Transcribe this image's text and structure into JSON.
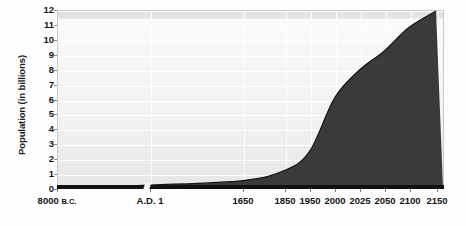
{
  "chart_data": {
    "type": "area",
    "title": "",
    "xlabel": "",
    "ylabel": "Population (in billions)",
    "ylim": [
      0,
      12
    ],
    "yticks": [
      0,
      1,
      2,
      3,
      4,
      5,
      6,
      7,
      8,
      9,
      10,
      11,
      12
    ],
    "ytick_labels": [
      "0",
      "1",
      "2",
      "3",
      "4",
      "5",
      "6",
      "7",
      "8",
      "9",
      "10",
      "11",
      "12"
    ],
    "grid": true,
    "legend": "none",
    "axis_break": true,
    "axis_break_note": "compressed time axis between 8000 B.C. and A.D. 1",
    "categories": [
      "8000 B.C.",
      "A.D. 1",
      "1650",
      "1850",
      "1950",
      "2000",
      "2025",
      "2050",
      "2100",
      "2150"
    ],
    "xtick_labels": [
      {
        "main": "8000",
        "small": "B.C."
      },
      {
        "main": "A.D. 1",
        "small": ""
      },
      {
        "main": "1650",
        "small": ""
      },
      {
        "main": "1850",
        "small": ""
      },
      {
        "main": "1950",
        "small": ""
      },
      {
        "main": "2000",
        "small": ""
      },
      {
        "main": "2025",
        "small": ""
      },
      {
        "main": "2050",
        "small": ""
      },
      {
        "main": "2100",
        "small": ""
      },
      {
        "main": "2150",
        "small": ""
      }
    ],
    "x_positions_px": [
      57,
      150,
      243,
      285,
      310,
      335,
      360,
      385,
      410,
      437
    ],
    "values": [
      0.005,
      0.2,
      0.5,
      1.2,
      2.5,
      6.1,
      8.0,
      9.3,
      10.9,
      12.0
    ],
    "series": [
      {
        "name": "World population",
        "points": [
          {
            "x": "8000 B.C.",
            "y": 0.005
          },
          {
            "x": "A.D. 1",
            "y": 0.2
          },
          {
            "x": "1650",
            "y": 0.5
          },
          {
            "x": "1850",
            "y": 1.2
          },
          {
            "x": "1950",
            "y": 2.5
          },
          {
            "x": "2000",
            "y": 6.1
          },
          {
            "x": "2025",
            "y": 8.0
          },
          {
            "x": "2050",
            "y": 9.3
          },
          {
            "x": "2100",
            "y": 10.9
          },
          {
            "x": "2150",
            "y": 12.0
          }
        ]
      }
    ],
    "colors": {
      "area_fill": "#3a3a3a",
      "plot_background": "#f0f0f0",
      "gridline": "#ffffff",
      "axis": "#111111",
      "text": "#141414"
    }
  },
  "caption": {
    "text": ""
  }
}
